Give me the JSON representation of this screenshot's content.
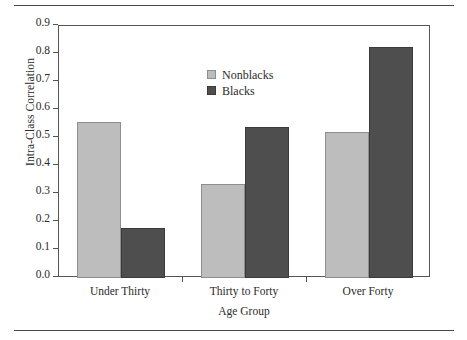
{
  "figure": {
    "background_color": "#ffffff",
    "rules": {
      "top": "horizontal-rule",
      "bottom": "horizontal-rule"
    }
  },
  "chart_data": {
    "type": "bar",
    "title": "",
    "xlabel": "Age Group",
    "ylabel": "Intra-Class Correlation",
    "categories": [
      "Under Thirty",
      "Thirty to Forty",
      "Over Forty"
    ],
    "series": [
      {
        "name": "Nonblacks",
        "color": "#bdbdbd",
        "values": [
          0.556,
          0.337,
          0.52
        ]
      },
      {
        "name": "Blacks",
        "color": "#4e4e4e",
        "values": [
          0.18,
          0.538,
          0.825
        ]
      }
    ],
    "ylim": [
      0.0,
      0.9
    ],
    "ytick_values": [
      0.0,
      0.1,
      0.2,
      0.3,
      0.4,
      0.5,
      0.6,
      0.7,
      0.8,
      0.9
    ],
    "ytick_labels": [
      "0.0",
      "0.1",
      "0.2",
      "0.3",
      "0.4",
      "0.5",
      "0.6",
      "0.7",
      "0.8",
      "0.9"
    ],
    "grid": false,
    "legend_position": "upper-left-inside",
    "legend_entries": [
      "Nonblacks",
      "Blacks"
    ]
  }
}
